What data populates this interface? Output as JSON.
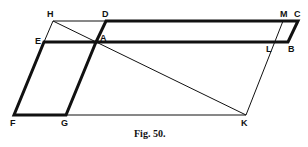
{
  "figure": {
    "caption": "Fig. 50.",
    "points": {
      "H": {
        "label": "H",
        "x": 53,
        "y": 21
      },
      "D": {
        "label": "D",
        "x": 106,
        "y": 21
      },
      "M": {
        "label": "M",
        "x": 283,
        "y": 21
      },
      "C": {
        "label": "C",
        "x": 298,
        "y": 21
      },
      "E": {
        "label": "E",
        "x": 44,
        "y": 42
      },
      "A": {
        "label": "A",
        "x": 96,
        "y": 42
      },
      "L": {
        "label": "L",
        "x": 276,
        "y": 42
      },
      "B": {
        "label": "B",
        "x": 288,
        "y": 42
      },
      "F": {
        "label": "F",
        "x": 14,
        "y": 115
      },
      "G": {
        "label": "G",
        "x": 66,
        "y": 115
      },
      "K": {
        "label": "K",
        "x": 246,
        "y": 115
      }
    },
    "thick_parallelograms": [
      {
        "name": "DCBA",
        "vertices": [
          "D",
          "C",
          "B",
          "A"
        ]
      },
      {
        "name": "EAGF",
        "vertices": [
          "E",
          "A",
          "G",
          "F"
        ]
      }
    ],
    "thin_lines": [
      [
        "H",
        "D"
      ],
      [
        "H",
        "E"
      ],
      [
        "H",
        "K"
      ],
      [
        "M",
        "K"
      ],
      [
        "G",
        "K"
      ],
      [
        "M",
        "C"
      ],
      [
        "L",
        "B"
      ]
    ],
    "stroke_color": "#111111"
  }
}
